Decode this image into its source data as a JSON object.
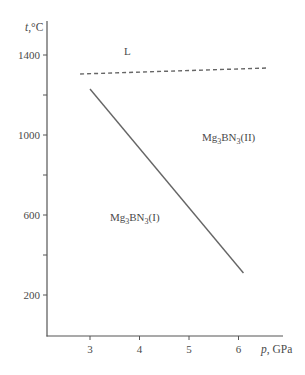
{
  "chart_data": {
    "type": "line",
    "title": "",
    "xlabel": "p, GPa",
    "ylabel": "t,°C",
    "xlabel_italic_part": "p",
    "xlabel_rest": ", GPa",
    "ylabel_italic_part": "t",
    "ylabel_rest": ",°C",
    "xlim": [
      2.15,
      6.9
    ],
    "ylim": [
      20,
      1580
    ],
    "x_ticks": [
      3,
      4,
      5,
      6
    ],
    "x_tick_labels": [
      "3",
      "4",
      "5",
      "6"
    ],
    "y_ticks": [
      200,
      400,
      600,
      800,
      1000,
      1200,
      1400
    ],
    "y_tick_labels": [
      "200",
      "",
      "600",
      "",
      "1000",
      "",
      "1400"
    ],
    "grid": false,
    "legend": null,
    "series": [
      {
        "name": "Mg3BN3(I)–Mg3BN3(II) boundary",
        "style": "solid",
        "color": "#666666",
        "x": [
          3.0,
          6.1
        ],
        "y": [
          1230,
          310
        ]
      },
      {
        "name": "Melting (L) boundary",
        "style": "dashed",
        "color": "#666666",
        "x": [
          2.8,
          6.6
        ],
        "y": [
          1305,
          1335
        ]
      }
    ],
    "annotations": [
      {
        "text": "L",
        "x": 3.75,
        "y": 1380
      },
      {
        "text": "Mg3BN3(II)",
        "base": "Mg",
        "sub1": "3",
        "mid": "BN",
        "sub2": "3",
        "suffix": "(II)",
        "x": 5.5,
        "y": 1000
      },
      {
        "text": "Mg3BN3(I)",
        "base": "Mg",
        "sub1": "3",
        "mid": "BN",
        "sub2": "3",
        "suffix": "(I)",
        "x": 3.55,
        "y": 600
      }
    ]
  }
}
